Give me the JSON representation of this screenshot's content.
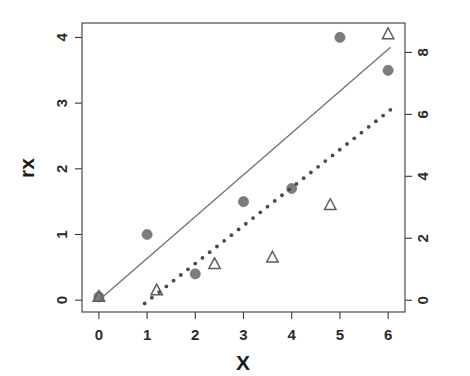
{
  "chart_data": {
    "type": "scatter",
    "title": "",
    "xlabel": "X",
    "ylabel": "rx",
    "y2label": "",
    "xlim": [
      -0.35,
      6.35
    ],
    "ylim": [
      -0.18,
      4.22
    ],
    "y2lim": [
      -0.38,
      8.95
    ],
    "grid": false,
    "legend": "none",
    "xticks": [
      0,
      1,
      2,
      3,
      4,
      5,
      6
    ],
    "xticklabels": [
      "0",
      "1",
      "2",
      "3",
      "4",
      "5",
      "6"
    ],
    "yticks": [
      0,
      1,
      2,
      3,
      4
    ],
    "yticklabels": [
      "0",
      "1",
      "2",
      "3",
      "4"
    ],
    "y2ticks": [
      0,
      2,
      4,
      6,
      8
    ],
    "y2ticklabels": [
      "0",
      "2",
      "4",
      "6",
      "8"
    ],
    "series": [
      {
        "name": "filled-circles",
        "marker": "circle",
        "fill": "#7d7d7d",
        "axis": "left",
        "x": [
          0,
          1,
          2,
          3,
          4,
          5,
          6
        ],
        "y": [
          0.05,
          1.0,
          0.4,
          1.5,
          1.7,
          4.0,
          3.5
        ]
      },
      {
        "name": "open-triangles",
        "marker": "triangle",
        "fill": "none",
        "stroke": "#5d5d5d",
        "axis": "left",
        "x": [
          0,
          1.2,
          2.4,
          3.6,
          4.8,
          6.0
        ],
        "y": [
          0.05,
          0.15,
          0.55,
          0.65,
          1.45,
          4.05
        ]
      },
      {
        "name": "solid-reference-line",
        "marker": "none",
        "style": "solid",
        "stroke": "#6e6e6e",
        "axis": "left",
        "x": [
          0.0,
          6.05
        ],
        "y": [
          0.0,
          3.85
        ]
      },
      {
        "name": "dotted-reference-line",
        "marker": "none",
        "style": "dotted",
        "stroke": "#4a4a4a",
        "axis": "left",
        "x": [
          0.95,
          6.05
        ],
        "y": [
          -0.05,
          2.9
        ]
      }
    ]
  },
  "colors": {
    "axis": "#3a3a3a",
    "text": "#1a1a1a",
    "circle_marker": "#7d7d7d",
    "triangle_marker": "#5d5d5d",
    "solid_line": "#6e6e6e",
    "dotted_line": "#4a4a4a",
    "background": "#ffffff"
  }
}
